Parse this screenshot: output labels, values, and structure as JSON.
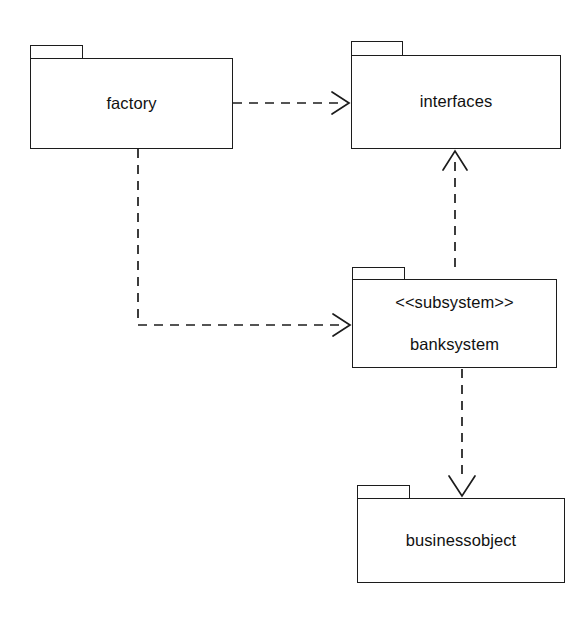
{
  "diagram": {
    "kind": "uml-package-diagram",
    "title": "",
    "background_color": "#ffffff",
    "stroke_color": "#1c1c1c",
    "text_color": "#111111",
    "packages": [
      {
        "id": "factory",
        "name": "factory",
        "stereotype": "",
        "tab": {
          "x": 30,
          "y": 45,
          "w": 53,
          "h": 14
        },
        "body": {
          "x": 30,
          "y": 58,
          "w": 203,
          "h": 91
        }
      },
      {
        "id": "interfaces",
        "name": "interfaces",
        "stereotype": "",
        "tab": {
          "x": 351,
          "y": 41,
          "w": 52,
          "h": 15
        },
        "body": {
          "x": 351,
          "y": 55,
          "w": 210,
          "h": 94
        }
      },
      {
        "id": "banksystem",
        "name": "banksystem",
        "stereotype": "<<subsystem>>",
        "tab": {
          "x": 352,
          "y": 267,
          "w": 53,
          "h": 13
        },
        "body": {
          "x": 352,
          "y": 279,
          "w": 205,
          "h": 89
        }
      },
      {
        "id": "businessobject",
        "name": "businessobject",
        "stereotype": "",
        "tab": {
          "x": 357,
          "y": 485,
          "w": 53,
          "h": 14
        },
        "body": {
          "x": 357,
          "y": 498,
          "w": 208,
          "h": 85
        }
      }
    ],
    "dependencies": [
      {
        "id": "factory-to-interfaces",
        "from": "factory",
        "to": "interfaces",
        "style": "dashed",
        "arrowhead": "open",
        "points": [
          [
            233,
            103
          ],
          [
            349,
            103
          ]
        ]
      },
      {
        "id": "factory-to-banksystem",
        "from": "factory",
        "to": "banksystem",
        "style": "dashed",
        "arrowhead": "open",
        "points": [
          [
            138,
            149
          ],
          [
            138,
            325
          ],
          [
            350,
            325
          ]
        ]
      },
      {
        "id": "banksystem-to-interfaces",
        "from": "banksystem",
        "to": "interfaces",
        "style": "dashed",
        "arrowhead": "open",
        "points": [
          [
            455,
            267
          ],
          [
            455,
            151
          ]
        ]
      },
      {
        "id": "banksystem-to-businessobject",
        "from": "banksystem",
        "to": "businessobject",
        "style": "dashed",
        "arrowhead": "open",
        "points": [
          [
            462,
            369
          ],
          [
            462,
            496
          ]
        ]
      }
    ]
  }
}
